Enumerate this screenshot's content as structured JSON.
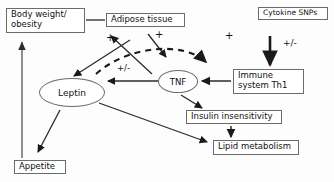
{
  "diagram": {
    "background_color": "#fdfdfd",
    "stroke_color": "#2b2b2b",
    "box_border_color": "#6b6b6b",
    "text_color": "#111111",
    "nodes": [
      {
        "id": "body_weight",
        "label": "Body weight/\nobesity",
        "shape": "box"
      },
      {
        "id": "adipose",
        "label": "Adipose tissue",
        "shape": "box"
      },
      {
        "id": "cytokine_snps",
        "label": "Cytokine SNPs",
        "shape": "box"
      },
      {
        "id": "immune",
        "label": "Immune\nsystem Th1",
        "shape": "box"
      },
      {
        "id": "insulin",
        "label": "Insulin insensitivity",
        "shape": "box"
      },
      {
        "id": "lipid",
        "label": "Lipid metabolism",
        "shape": "box"
      },
      {
        "id": "appetite",
        "label": "Appetite",
        "shape": "box"
      },
      {
        "id": "leptin",
        "label": "Leptin",
        "shape": "ellipse"
      },
      {
        "id": "tnf",
        "label": "TNF",
        "shape": "ellipse"
      }
    ],
    "edge_labels": [
      {
        "id": "plus_left",
        "text": "+"
      },
      {
        "id": "plus_mid",
        "text": "+"
      },
      {
        "id": "plus_right",
        "text": "+"
      },
      {
        "id": "pm_center",
        "text": "+/-"
      },
      {
        "id": "pm_right",
        "text": "+/-"
      }
    ],
    "edges": [
      {
        "from": "body_weight",
        "to": "adipose",
        "style": "solid",
        "arrow": "none"
      },
      {
        "from": "adipose",
        "to": "leptin",
        "style": "solid",
        "arrow": "end",
        "sign": "+"
      },
      {
        "from": "adipose",
        "to": "tnf",
        "style": "solid",
        "arrow": "end",
        "sign": "+"
      },
      {
        "from": "leptin",
        "to": "adipose",
        "style": "solid",
        "arrow": "end"
      },
      {
        "from": "leptin",
        "to": "immune",
        "style": "dashed",
        "arrow": "end",
        "sign": "+"
      },
      {
        "from": "tnf",
        "to": "leptin",
        "style": "solid",
        "arrow": "end",
        "sign": "+/-"
      },
      {
        "from": "cytokine_snps",
        "to": "immune",
        "style": "solid",
        "arrow": "end",
        "sign": "+/-"
      },
      {
        "from": "immune",
        "to": "tnf",
        "style": "solid",
        "arrow": "end"
      },
      {
        "from": "tnf",
        "to": "insulin",
        "style": "solid",
        "arrow": "end"
      },
      {
        "from": "insulin",
        "to": "lipid",
        "style": "solid",
        "arrow": "end"
      },
      {
        "from": "leptin",
        "to": "lipid",
        "style": "solid",
        "arrow": "end"
      },
      {
        "from": "leptin",
        "to": "appetite",
        "style": "solid",
        "arrow": "end"
      },
      {
        "from": "appetite",
        "to": "body_weight",
        "style": "solid",
        "arrow": "end"
      }
    ]
  }
}
